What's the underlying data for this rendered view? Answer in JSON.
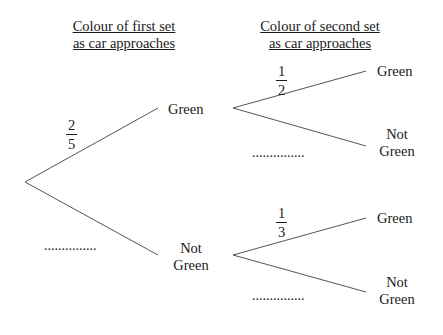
{
  "headings": {
    "first": {
      "line1": "Colour of first set",
      "line2": "as car approaches"
    },
    "second": {
      "line1": "Colour of second set",
      "line2": "as car approaches"
    }
  },
  "first_set": {
    "upper": {
      "label": "Green",
      "probability": {
        "numerator": "1",
        "denominator": "1"
      }
    },
    "lower": {
      "label_line1": "Not",
      "label_line2": "Green",
      "blank": "..............."
    },
    "given_probability": {
      "numerator": "2",
      "denominator": "5"
    }
  },
  "second_set_after_green": {
    "upper": {
      "label": "Green",
      "probability": {
        "numerator": "1",
        "denominator": "2"
      }
    },
    "lower": {
      "label_line1": "Not",
      "label_line2": "Green",
      "blank": "..............."
    }
  },
  "second_set_after_not_green": {
    "upper": {
      "label": "Green",
      "probability": {
        "numerator": "1",
        "denominator": "3"
      }
    },
    "lower": {
      "label_line1": "Not",
      "label_line2": "Green",
      "blank": "..............."
    }
  },
  "colors": {
    "line": "#555555",
    "text": "#1a1a1a",
    "background": "#ffffff"
  }
}
